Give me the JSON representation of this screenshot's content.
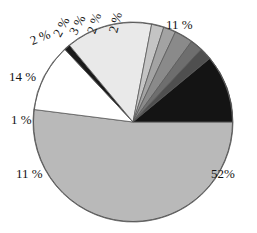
{
  "chart_data": {
    "type": "pie",
    "title": "",
    "subtitle": "",
    "xlabel": "",
    "ylabel": "",
    "legend_position": "none",
    "grid": false,
    "units": "percent",
    "total": 100,
    "categories": [
      "Slice 1",
      "Slice 2",
      "Slice 3",
      "Slice 4",
      "Slice 5",
      "Slice 6",
      "Slice 7",
      "Slice 8",
      "Slice 9",
      "Slice 10"
    ],
    "values": [
      52,
      11,
      1,
      14,
      2,
      2,
      3,
      2,
      2,
      11
    ],
    "labels": [
      "52%",
      "11 %",
      "1 %",
      "14 %",
      "2 %",
      "2 %",
      "3 %",
      "2 %",
      "2 %",
      "11 %"
    ],
    "colors": [
      "#b9b9b9",
      "#ffffff",
      "#1a1a1a",
      "#e9e9e9",
      "#c4c4c4",
      "#a3a3a3",
      "#8a8a8a",
      "#6e6e6e",
      "#4f4f4f",
      "#141414"
    ],
    "start_angle_deg": 0,
    "direction": "clockwise",
    "slices": [
      {
        "label": "52%",
        "value": 52,
        "color": "#b9b9b9",
        "start_deg": 0,
        "end_deg": 187.2
      },
      {
        "label": "11 %",
        "value": 11,
        "color": "#ffffff",
        "start_deg": 187.2,
        "end_deg": 226.8
      },
      {
        "label": "1 %",
        "value": 1,
        "color": "#1a1a1a",
        "start_deg": 226.8,
        "end_deg": 230.4
      },
      {
        "label": "14 %",
        "value": 14,
        "color": "#e9e9e9",
        "start_deg": 230.4,
        "end_deg": 280.8
      },
      {
        "label": "2 %",
        "value": 2,
        "color": "#c4c4c4",
        "start_deg": 280.8,
        "end_deg": 288.0
      },
      {
        "label": "2 %",
        "value": 2,
        "color": "#a3a3a3",
        "start_deg": 288.0,
        "end_deg": 295.2
      },
      {
        "label": "3 %",
        "value": 3,
        "color": "#8a8a8a",
        "start_deg": 295.2,
        "end_deg": 306.0
      },
      {
        "label": "2 %",
        "value": 2,
        "color": "#6e6e6e",
        "start_deg": 306.0,
        "end_deg": 313.2
      },
      {
        "label": "2 %",
        "value": 2,
        "color": "#4f4f4f",
        "start_deg": 313.2,
        "end_deg": 320.4
      },
      {
        "label": "11 %",
        "value": 11,
        "color": "#141414",
        "start_deg": 320.4,
        "end_deg": 360.0
      }
    ]
  },
  "labels": {
    "pct_52": "52%",
    "pct_11_bottom": "11 %",
    "pct_1": "1 %",
    "pct_14": "14 %",
    "pct_2_a": "2 %",
    "pct_2_b": "2 %",
    "pct_3": "3 %",
    "pct_2_c": "2 %",
    "pct_2_d": "2 %",
    "pct_11_top": "11 %"
  },
  "style": {
    "background": "#ffffff",
    "outline": "#555555",
    "text_color": "#141414"
  }
}
